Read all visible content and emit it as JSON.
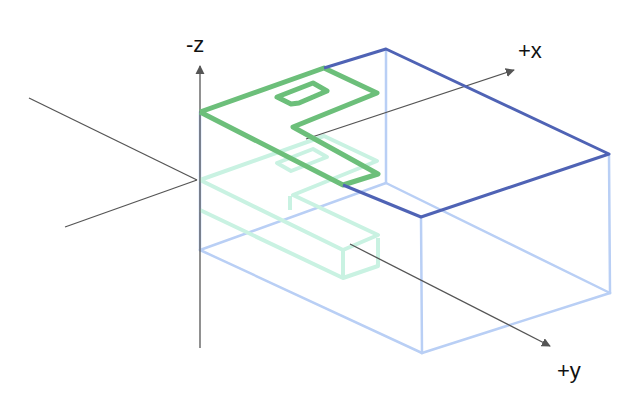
{
  "diagram": {
    "title": "",
    "axes": {
      "neg_z": {
        "label": "-z"
      },
      "pos_x": {
        "label": "+x"
      },
      "pos_y": {
        "label": "+y"
      }
    },
    "colors": {
      "axis": "#555555",
      "box_top_edge": "#4f63b5",
      "box_hidden_edge": "#b9cff5",
      "path_top": "#6cbf7a",
      "path_lower": "#c9f2e2"
    }
  }
}
